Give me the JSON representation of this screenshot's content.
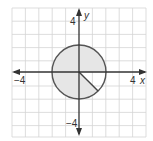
{
  "diagram": {
    "type": "coordinate-plane",
    "x_axis_label": "x",
    "y_axis_label": "y",
    "x_tick_pos": "4",
    "x_tick_neg": "−4",
    "y_tick_pos": "4",
    "y_tick_neg": "−4",
    "grid_range": [
      -5,
      5
    ],
    "shape": {
      "kind": "circle",
      "center": [
        0,
        0
      ],
      "radius": 2,
      "shaded_region": "circle minus sector from 0 to -45 degrees",
      "unshaded_sector_degrees": [
        -45,
        0
      ]
    },
    "colors": {
      "fill": "#e6e6e6",
      "stroke": "#555555",
      "grid": "#d4d4d4",
      "axis": "#333333"
    }
  }
}
